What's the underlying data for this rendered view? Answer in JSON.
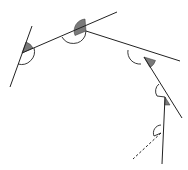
{
  "diagram": {
    "title": "",
    "colors": {
      "line": "#222222",
      "shaded_angle": "#7a7a7a",
      "background": "#ffffff"
    },
    "segments": [
      {
        "id": "line-1",
        "x1": 10,
        "y1": 87,
        "x2": 32,
        "y2": 26,
        "style": "solid"
      },
      {
        "id": "line-2",
        "x1": 22,
        "y1": 53,
        "x2": 117,
        "y2": 12,
        "style": "solid"
      },
      {
        "id": "line-3",
        "x1": 86,
        "y1": 31,
        "x2": 180,
        "y2": 61,
        "style": "solid"
      },
      {
        "id": "line-4",
        "x1": 144,
        "y1": 57,
        "x2": 182,
        "y2": 118,
        "style": "solid"
      },
      {
        "id": "line-5",
        "x1": 165,
        "y1": 97,
        "x2": 162,
        "y2": 164,
        "style": "solid"
      },
      {
        "id": "line-6",
        "x1": 161,
        "y1": 133,
        "x2": 133,
        "y2": 159,
        "style": "dashed"
      }
    ],
    "vertices": [
      {
        "id": "A",
        "x": 22,
        "y": 53
      },
      {
        "id": "B",
        "x": 86,
        "y": 31
      },
      {
        "id": "C",
        "x": 144,
        "y": 57
      },
      {
        "id": "D",
        "x": 165,
        "y": 97
      },
      {
        "id": "E",
        "x": 161,
        "y": 133
      }
    ],
    "labels": []
  }
}
